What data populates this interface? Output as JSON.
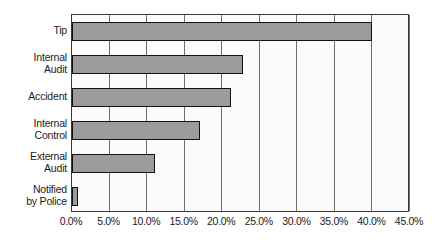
{
  "chart_data": {
    "type": "bar",
    "orientation": "horizontal",
    "title": "",
    "subtitle": "",
    "xlabel": "",
    "ylabel": "",
    "categories": [
      "Tip",
      "Internal\nAudit",
      "Accident",
      "Internal\nControl",
      "External\nAudit",
      "Notified\nby Police"
    ],
    "values": [
      40.0,
      22.8,
      21.2,
      17.0,
      11.0,
      0.8
    ],
    "value_suffix": "%",
    "xlim": [
      0,
      45
    ],
    "xtick_values": [
      0,
      5,
      10,
      15,
      20,
      25,
      30,
      35,
      40,
      45
    ],
    "xtick_labels": [
      "0.0%",
      "5.0%",
      "10.0%",
      "15.0%",
      "20.0%",
      "25.0%",
      "30.0%",
      "35.0%",
      "40.0%",
      "45.0%"
    ],
    "grid": {
      "vertical": true,
      "horizontal": false
    },
    "legend": {
      "visible": false,
      "position": "none",
      "entries": []
    },
    "annotations": [],
    "colors": {
      "bar_fill": "#9b9b9b",
      "bar_border": "#111111",
      "plot_background": "#fbfbfb",
      "plot_border": "#3b3b3b",
      "gridline": "#6e6e6e",
      "text": "#1b1b1b",
      "page_background": "#ffffff"
    }
  }
}
